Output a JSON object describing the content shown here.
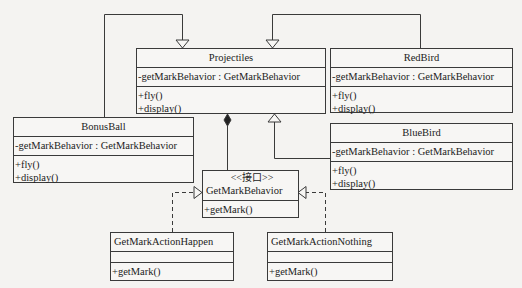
{
  "diagram": {
    "type": "UML class diagram",
    "colors": {
      "line": "#3a3a3a",
      "background": "#f4f3f1",
      "box": "#f7f6f4"
    },
    "classes": {
      "projectiles": {
        "name": "Projectiles",
        "attributes": [
          "-getMarkBehavior : GetMarkBehavior"
        ],
        "methods": [
          "+fly()",
          "+display()"
        ]
      },
      "redbird": {
        "name": "RedBird",
        "attributes": [
          "-getMarkBehavior : GetMarkBehavior"
        ],
        "methods": [
          "+fly()",
          "+display()"
        ]
      },
      "bonusball": {
        "name": "BonusBall",
        "attributes": [
          "-getMarkBehavior : GetMarkBehavior"
        ],
        "methods": [
          "+fly()",
          "+display()"
        ]
      },
      "bluebird": {
        "name": "BlueBird",
        "attributes": [
          "-getMarkBehavior : GetMarkBehavior"
        ],
        "methods": [
          "+fly()",
          "+display()"
        ]
      },
      "getmarkbehavior": {
        "stereotype": "<<接口>>",
        "name": "GetMarkBehavior",
        "methods": [
          "+getMark()"
        ]
      },
      "happen": {
        "name": "GetMarkActionHappen",
        "attributes": [],
        "methods": [
          "+getMark()"
        ]
      },
      "nothing": {
        "name": "GetMarkActionNothing",
        "attributes": [],
        "methods": [
          "+getMark()"
        ]
      }
    },
    "relationships": [
      {
        "from": "BonusBall",
        "to": "Projectiles",
        "kind": "generalization"
      },
      {
        "from": "RedBird",
        "to": "Projectiles",
        "kind": "generalization"
      },
      {
        "from": "BlueBird",
        "to": "Projectiles",
        "kind": "generalization"
      },
      {
        "from": "Projectiles",
        "to": "GetMarkBehavior",
        "kind": "composition"
      },
      {
        "from": "GetMarkActionHappen",
        "to": "GetMarkBehavior",
        "kind": "realization"
      },
      {
        "from": "GetMarkActionNothing",
        "to": "GetMarkBehavior",
        "kind": "realization"
      }
    ]
  }
}
